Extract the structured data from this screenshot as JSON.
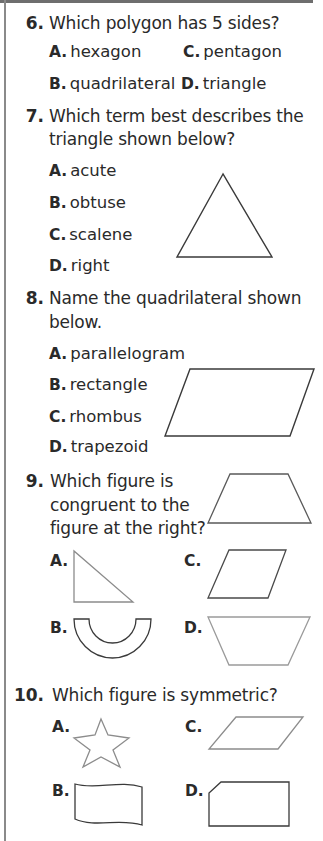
{
  "questions": [
    {
      "number": "6.",
      "lines": [
        "Which polygon has 5 sides?"
      ],
      "options": [
        {
          "label": "A.",
          "text": "hexagon"
        },
        {
          "label": "B.",
          "text": "quadrilateral"
        },
        {
          "label": "C.",
          "text": "pentagon"
        },
        {
          "label": "D.",
          "text": "triangle"
        }
      ]
    },
    {
      "number": "7.",
      "lines": [
        "Which term best describes the",
        "triangle shown below?"
      ],
      "options": [
        {
          "label": "A.",
          "text": "acute"
        },
        {
          "label": "B.",
          "text": "obtuse"
        },
        {
          "label": "C.",
          "text": "scalene"
        },
        {
          "label": "D.",
          "text": "right"
        }
      ],
      "figure": "triangle-icon"
    },
    {
      "number": "8.",
      "lines": [
        "Name the quadrilateral shown",
        "below."
      ],
      "options": [
        {
          "label": "A.",
          "text": "parallelogram"
        },
        {
          "label": "B.",
          "text": "rectangle"
        },
        {
          "label": "C.",
          "text": "rhombus"
        },
        {
          "label": "D.",
          "text": "trapezoid"
        }
      ],
      "figure": "parallelogram-icon"
    },
    {
      "number": "9.",
      "lines": [
        "Which figure is",
        "congruent to the",
        "figure at the right?"
      ],
      "figure": "trapezoid-icon",
      "options": [
        {
          "label": "A.",
          "figure": "right-triangle-icon"
        },
        {
          "label": "B.",
          "figure": "half-ring-icon"
        },
        {
          "label": "C.",
          "figure": "parallelogram-icon"
        },
        {
          "label": "D.",
          "figure": "inverted-trapezoid-icon"
        }
      ]
    },
    {
      "number": "10.",
      "lines": [
        "Which figure is symmetric?"
      ],
      "options": [
        {
          "label": "A.",
          "figure": "star-icon"
        },
        {
          "label": "B.",
          "figure": "wavy-flag-icon"
        },
        {
          "label": "C.",
          "figure": "parallelogram-icon"
        },
        {
          "label": "D.",
          "figure": "clipped-rectangle-icon"
        }
      ]
    }
  ],
  "colors": {
    "text": "#2a2a2a",
    "stroke_dark": "#3a3a3a",
    "stroke_gray": "#8c8c8c",
    "rule": "#6e6e6e"
  }
}
